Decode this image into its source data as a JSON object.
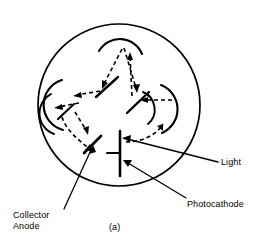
{
  "figure": {
    "caption": "(a)",
    "background_color": "#ffffff",
    "line_color": "#000000",
    "dash_pattern": "4 3"
  },
  "labels": {
    "collector_anode": "Collector\nAnode",
    "collector_anode_line1": "Collector",
    "collector_anode_line2": "Anode",
    "light": "Light",
    "photocathode": "Photocathode",
    "caption": "(a)"
  },
  "geometry": {
    "envelope": {
      "cx": 119,
      "cy": 105,
      "r": 81
    },
    "photocathode": {
      "bar_x": 120,
      "bar_y1": 131,
      "bar_y2": 176,
      "stub_y": 153,
      "stub_x2": 108
    },
    "collector_anode": {
      "x1": 85,
      "y1": 152,
      "x2": 100,
      "y2": 137
    },
    "dynodes": [
      {
        "name": "dynode-top",
        "cx": 120,
        "cy": 58,
        "r": 22,
        "start_deg": 200,
        "end_deg": 340
      },
      {
        "name": "dynode-left",
        "cx": 69,
        "cy": 104,
        "r": 24,
        "start_deg": 300,
        "end_deg": 60
      },
      {
        "name": "dynode-right",
        "cx": 151,
        "cy": 108,
        "r": 24,
        "start_deg": 120,
        "end_deg": 240
      }
    ],
    "electrode_bars": [
      {
        "name": "electrode-upper-left",
        "x1": 96,
        "y1": 96,
        "x2": 117,
        "y2": 78
      },
      {
        "name": "electrode-center",
        "x1": 129,
        "y1": 112,
        "x2": 150,
        "y2": 93
      },
      {
        "name": "electrode-lower-left",
        "x1": 60,
        "y1": 118,
        "x2": 76,
        "y2": 103
      }
    ]
  },
  "leader_lines": [
    {
      "name": "leader-light",
      "from_label": "Light",
      "x1": 217,
      "y1": 162,
      "x2": 124,
      "y2": 139
    },
    {
      "name": "leader-photocathode",
      "from_label": "Photocathode",
      "x1": 186,
      "y1": 198,
      "x2": 124,
      "y2": 162
    },
    {
      "name": "leader-collector-anode",
      "from_label": "Collector Anode",
      "x1": 66,
      "y1": 207,
      "x2": 94,
      "y2": 147
    }
  ],
  "trajectories": [
    {
      "name": "path-cathode-to-right-dynode",
      "style": "dashed",
      "arrow": true
    },
    {
      "name": "path-right-dynode-to-center",
      "style": "dashed",
      "arrow": true
    },
    {
      "name": "path-center-to-top-dynode",
      "style": "dashed",
      "arrow": true
    },
    {
      "name": "path-top-dynode-to-left",
      "style": "dashed",
      "arrow": true
    },
    {
      "name": "path-top-dynode-to-center",
      "style": "dashed",
      "arrow": true
    },
    {
      "name": "path-left-dynode-to-anode",
      "style": "dashed",
      "arrow": true
    },
    {
      "name": "path-center-to-left-dynode",
      "style": "dashed",
      "arrow": true
    },
    {
      "name": "path-right-inner-to-center",
      "style": "dashed",
      "arrow": true
    }
  ]
}
